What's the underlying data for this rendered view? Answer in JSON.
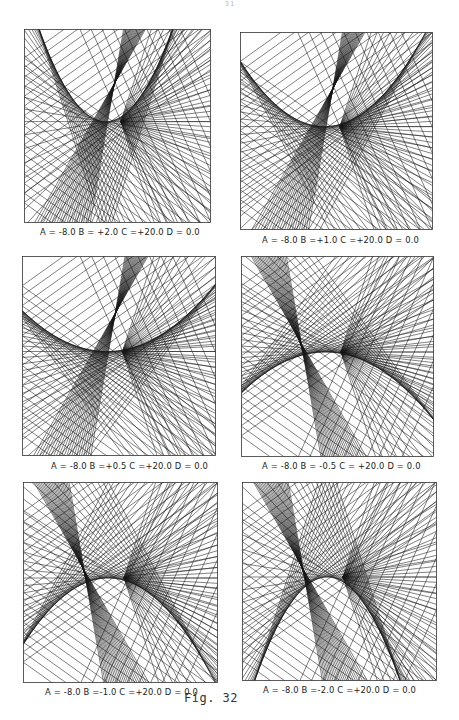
{
  "page": {
    "number": "31",
    "caption": "Fig. 32"
  },
  "panels": [
    {
      "id": "top-left",
      "label": "A = -8.0  B = +2.0  C =+20.0  D = 0.0",
      "params": {
        "A": -8.0,
        "B": 2.0,
        "C": 20.0,
        "D": 0.0
      },
      "frame": {
        "x": 24,
        "y": 29,
        "w": 186,
        "h": 193
      },
      "label_pos": {
        "x": 40,
        "y": 226
      }
    },
    {
      "id": "top-right",
      "label": "A = -8.0  B =+1.0  C =+20.0  D = 0.0",
      "params": {
        "A": -8.0,
        "B": 1.0,
        "C": 20.0,
        "D": 0.0
      },
      "frame": {
        "x": 240,
        "y": 32,
        "w": 192,
        "h": 197
      },
      "label_pos": {
        "x": 262,
        "y": 234
      }
    },
    {
      "id": "middle-left",
      "label": "A = -8.0  B =+0.5  C =+20.0  D = 0.0",
      "params": {
        "A": -8.0,
        "B": 0.5,
        "C": 20.0,
        "D": 0.0
      },
      "frame": {
        "x": 22,
        "y": 256,
        "w": 193,
        "h": 199
      },
      "label_pos": {
        "x": 51,
        "y": 460
      }
    },
    {
      "id": "middle-right",
      "label": "A = -8.0  B = -0.5  C = +20.0  D = 0.0",
      "params": {
        "A": -8.0,
        "B": -0.5,
        "C": 20.0,
        "D": 0.0
      },
      "frame": {
        "x": 241,
        "y": 256,
        "w": 192,
        "h": 200
      },
      "label_pos": {
        "x": 262,
        "y": 460
      }
    },
    {
      "id": "bottom-left",
      "label": "A = -8.0  B =-1.0  C =+20.0  D = 0.0",
      "params": {
        "A": -8.0,
        "B": -1.0,
        "C": 20.0,
        "D": 0.0
      },
      "frame": {
        "x": 23,
        "y": 482,
        "w": 194,
        "h": 200
      },
      "label_pos": {
        "x": 45,
        "y": 686
      }
    },
    {
      "id": "bottom-right",
      "label": "A = -8.0  B =-2.0  C =+20.0  D = 0.0",
      "params": {
        "A": -8.0,
        "B": -2.0,
        "C": 20.0,
        "D": 0.0
      },
      "frame": {
        "x": 242,
        "y": 482,
        "w": 194,
        "h": 198
      },
      "label_pos": {
        "x": 263,
        "y": 684
      }
    }
  ],
  "style": {
    "line_color": "#1a1a1a",
    "frame_color": "#333333",
    "background": "#ffffff"
  }
}
